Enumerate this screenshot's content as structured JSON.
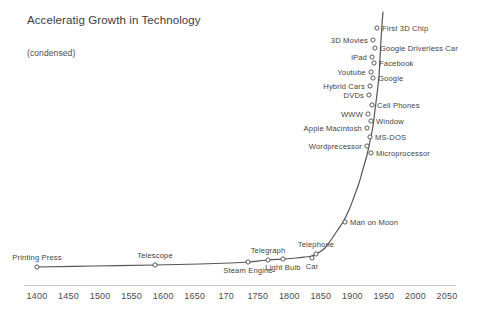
{
  "chart_data": {
    "type": "line",
    "title": "Acceleratig Growth in Technology",
    "subtitle": "(condensed)",
    "xlabel": "",
    "ylabel": "",
    "xlim": [
      1400,
      2060
    ],
    "grid": false,
    "legend": null,
    "x_tick_labels": [
      "1400",
      "1450",
      "1500",
      "1550",
      "1600",
      "1650",
      "170",
      "1750",
      "1800",
      "1850",
      "1900",
      "1950",
      "2000",
      "2050"
    ],
    "x_tick_values": [
      1400,
      1450,
      1500,
      1550,
      1600,
      1650,
      1700,
      1750,
      1800,
      1850,
      1900,
      1950,
      2000,
      2050
    ],
    "annotations": [
      {
        "label": "Printing Press",
        "x": 1440,
        "px": 37,
        "py": 267,
        "side": "above"
      },
      {
        "label": "Telescope",
        "x": 1608,
        "px": 155,
        "py": 265,
        "side": "above"
      },
      {
        "label": "Steam Engine",
        "x": 1775,
        "px": 248,
        "py": 262,
        "side": "below"
      },
      {
        "label": "Telegraph",
        "x": 1809,
        "px": 268,
        "py": 260,
        "side": "above"
      },
      {
        "label": "Light Bulb",
        "x": 1830,
        "px": 283,
        "py": 259,
        "side": "below"
      },
      {
        "label": "Telephone",
        "x": 1876,
        "px": 316,
        "py": 254,
        "side": "above"
      },
      {
        "label": "Car",
        "x": 1886,
        "px": 312,
        "py": 258,
        "side": "below"
      },
      {
        "label": "Man on Moon",
        "x": 1934,
        "px": 345,
        "py": 222,
        "side": "right"
      },
      {
        "label": "Microprocessor",
        "x": 1990,
        "px": 371,
        "py": 153,
        "side": "right"
      },
      {
        "label": "Wordprecessor",
        "x": 1991,
        "px": 367,
        "py": 146,
        "side": "left"
      },
      {
        "label": "MS-DOS",
        "x": 1992,
        "px": 370,
        "py": 137,
        "side": "right"
      },
      {
        "label": "Apple Macintosh",
        "x": 1993,
        "px": 367,
        "py": 128,
        "side": "left"
      },
      {
        "label": "Window",
        "x": 1994,
        "px": 371,
        "py": 121,
        "side": "right"
      },
      {
        "label": "WWW",
        "x": 1995,
        "px": 368,
        "py": 114,
        "side": "left"
      },
      {
        "label": "Cell Phones",
        "x": 1996,
        "px": 372,
        "py": 105,
        "side": "right"
      },
      {
        "label": "DVDs",
        "x": 1997,
        "px": 369,
        "py": 95,
        "side": "left"
      },
      {
        "label": "Hybrid Cars",
        "x": 1998,
        "px": 370,
        "py": 86,
        "side": "left"
      },
      {
        "label": "Google",
        "x": 1999,
        "px": 373,
        "py": 78,
        "side": "right"
      },
      {
        "label": "Youtube",
        "x": 2000,
        "px": 371,
        "py": 72,
        "side": "left"
      },
      {
        "label": "Facebook",
        "x": 2001,
        "px": 374,
        "py": 63,
        "side": "right"
      },
      {
        "label": "iPad",
        "x": 2002,
        "px": 372,
        "py": 57,
        "side": "left"
      },
      {
        "label": "Google Driverless Car",
        "x": 2003,
        "px": 375,
        "py": 48,
        "side": "right"
      },
      {
        "label": "3D Movies",
        "x": 2004,
        "px": 373,
        "py": 40,
        "side": "left"
      },
      {
        "label": "First 3D Chip",
        "x": 2005,
        "px": 377,
        "py": 28,
        "side": "right"
      }
    ],
    "curve_points_px": [
      [
        37,
        267
      ],
      [
        95,
        266
      ],
      [
        155,
        265
      ],
      [
        200,
        264
      ],
      [
        230,
        263
      ],
      [
        248,
        262
      ],
      [
        268,
        260
      ],
      [
        283,
        259
      ],
      [
        296,
        258
      ],
      [
        305,
        257
      ],
      [
        312,
        256
      ],
      [
        318,
        253
      ],
      [
        325,
        248
      ],
      [
        331,
        240
      ],
      [
        337,
        231
      ],
      [
        343,
        222
      ],
      [
        349,
        210
      ],
      [
        354,
        197
      ],
      [
        359,
        183
      ],
      [
        363,
        169
      ],
      [
        367,
        155
      ],
      [
        370,
        141
      ],
      [
        373,
        126
      ],
      [
        375,
        110
      ],
      [
        377,
        94
      ],
      [
        379,
        76
      ],
      [
        380,
        58
      ],
      [
        381,
        40
      ],
      [
        382,
        24
      ],
      [
        383,
        12
      ]
    ],
    "colors": {
      "line": "#555555",
      "marker_stroke": "#4a4a4a",
      "marker_fill": "#ffffff",
      "axis": "#c8c8c8",
      "text": "#3f3f3f",
      "background": "#ffffff"
    }
  }
}
